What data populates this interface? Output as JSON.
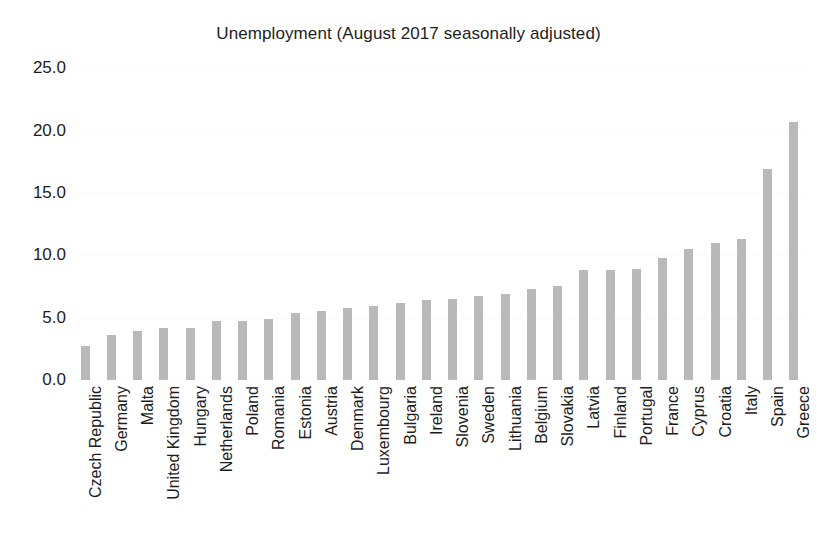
{
  "chart_data": {
    "type": "bar",
    "title": "Unemployment (August 2017 seasonally adjusted)",
    "xlabel": "",
    "ylabel": "",
    "ylim": [
      0.0,
      25.9
    ],
    "yticks": [
      0.0,
      5.0,
      10.0,
      15.0,
      20.0,
      25.0
    ],
    "ytick_labels": [
      "0.0",
      "5.0",
      "10.0",
      "15.0",
      "20.0",
      "25.0"
    ],
    "grid": false,
    "legend": "none",
    "bar_color": "#b9b9b9",
    "categories": [
      "Czech Republic",
      "Germany",
      "Malta",
      "United Kingdom",
      "Hungary",
      "Netherlands",
      "Poland",
      "Romania",
      "Estonia",
      "Austria",
      "Denmark",
      "Luxembourg",
      "Bulgaria",
      "Ireland",
      "Slovenia",
      "Sweden",
      "Lithuania",
      "Belgium",
      "Slovakia",
      "Latvia",
      "Finland",
      "Portugal",
      "France",
      "Cyprus",
      "Croatia",
      "Italy",
      "Spain",
      "Greece"
    ],
    "values": [
      2.7,
      3.6,
      3.9,
      4.2,
      4.2,
      4.7,
      4.7,
      4.9,
      5.4,
      5.5,
      5.8,
      5.9,
      6.2,
      6.4,
      6.5,
      6.7,
      6.9,
      7.3,
      7.5,
      8.8,
      8.8,
      8.9,
      9.8,
      10.5,
      11.0,
      11.3,
      16.9,
      20.7
    ]
  }
}
